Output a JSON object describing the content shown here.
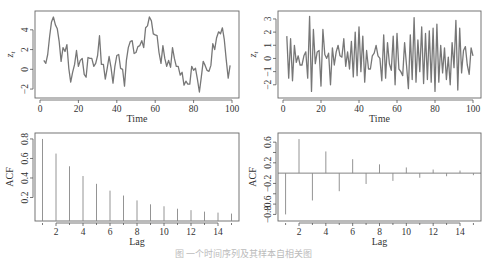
{
  "figure": {
    "caption": "图 一个时间序列及其样本自相关图"
  },
  "chart_data": [
    {
      "type": "line",
      "panel": "top-left",
      "xlabel": "Time",
      "ylabel": "z_t",
      "xlim": [
        0,
        100
      ],
      "ylim": [
        -2.5,
        5.5
      ],
      "xticks": [
        0,
        20,
        40,
        60,
        80,
        100
      ],
      "yticks": [
        -2,
        0,
        2,
        4
      ],
      "x": [
        2,
        3,
        4,
        5,
        6,
        7,
        8,
        9,
        10,
        11,
        12,
        13,
        14,
        15,
        16,
        17,
        18,
        19,
        20,
        21,
        22,
        23,
        24,
        25,
        26,
        27,
        28,
        29,
        30,
        31,
        32,
        33,
        34,
        35,
        36,
        37,
        38,
        39,
        40,
        41,
        42,
        43,
        44,
        45,
        46,
        47,
        48,
        49,
        50,
        51,
        52,
        53,
        54,
        55,
        56,
        57,
        58,
        59,
        60,
        61,
        62,
        63,
        64,
        65,
        66,
        67,
        68,
        69,
        70,
        71,
        72,
        73,
        74,
        75,
        76,
        77,
        78,
        79,
        80,
        81,
        82,
        83,
        84,
        85,
        86,
        87,
        88,
        89,
        90,
        91,
        92,
        93,
        94,
        95,
        96,
        97,
        98,
        99,
        100
      ],
      "values": [
        0.9,
        0.6,
        1.5,
        3.3,
        4.8,
        5.3,
        4.5,
        4.1,
        2.8,
        0.8,
        2.2,
        1.8,
        2.5,
        0.1,
        -1.3,
        -0.3,
        0.5,
        1.9,
        0.3,
        0.9,
        1.1,
        -0.5,
        -0.8,
        1.2,
        1.1,
        1.1,
        0.3,
        0.6,
        1.4,
        3.4,
        0.5,
        0.5,
        -1.0,
        0.1,
        1.3,
        0.2,
        -1.4,
        0.3,
        1.4,
        1.5,
        0.1,
        0.0,
        -1.7,
        0.9,
        2.2,
        2.8,
        2.9,
        1.6,
        1.7,
        2.3,
        2.4,
        2.9,
        2.2,
        4.2,
        4.4,
        5.3,
        4.9,
        3.6,
        3.5,
        3.4,
        1.7,
        0.6,
        2.4,
        1.1,
        0.3,
        0.9,
        0.2,
        2.2,
        1.1,
        0.3,
        0.3,
        -0.6,
        -0.3,
        -1.6,
        -1.2,
        -1.5,
        -1.5,
        0.3,
        -0.1,
        0.1,
        -1.0,
        -2.3,
        -0.8,
        0.8,
        0.4,
        -0.1,
        -0.2,
        0.4,
        2.6,
        2.0,
        3.2,
        3.8,
        3.6,
        4.2,
        3.0,
        1.0,
        -0.9,
        0.4
      ]
    },
    {
      "type": "line",
      "panel": "top-right",
      "xlabel": "Time",
      "ylabel": "z_t",
      "xlim": [
        0,
        100
      ],
      "ylim": [
        -2.7,
        3.3
      ],
      "xticks": [
        0,
        20,
        40,
        60,
        80,
        100
      ],
      "yticks": [
        -2,
        -1,
        0,
        1,
        2,
        3
      ],
      "x": [
        2,
        3,
        4,
        5,
        6,
        7,
        8,
        9,
        10,
        11,
        12,
        13,
        14,
        15,
        16,
        17,
        18,
        19,
        20,
        21,
        22,
        23,
        24,
        25,
        26,
        27,
        28,
        29,
        30,
        31,
        32,
        33,
        34,
        35,
        36,
        37,
        38,
        39,
        40,
        41,
        42,
        43,
        44,
        45,
        46,
        47,
        48,
        49,
        50,
        51,
        52,
        53,
        54,
        55,
        56,
        57,
        58,
        59,
        60,
        61,
        62,
        63,
        64,
        65,
        66,
        67,
        68,
        69,
        70,
        71,
        72,
        73,
        74,
        75,
        76,
        77,
        78,
        79,
        80,
        81,
        82,
        83,
        84,
        85,
        86,
        87,
        88,
        89,
        90,
        91,
        92,
        93,
        94,
        95,
        96,
        97,
        98,
        99,
        100
      ],
      "values": [
        1.7,
        -1.5,
        1.5,
        -1.7,
        1.0,
        -0.3,
        0.2,
        -0.5,
        -0.5,
        0.2,
        0.5,
        -1.5,
        3.2,
        -2.5,
        2.2,
        -0.4,
        0.5,
        0.6,
        -2.1,
        2.2,
        0.3,
        0.0,
        0.4,
        -2.0,
        0.8,
        -0.5,
        0.5,
        1.0,
        0.2,
        0.1,
        1.5,
        -0.6,
        0.5,
        -0.8,
        1.3,
        -1.4,
        2.0,
        -1.3,
        2.4,
        -1.0,
        1.7,
        -1.8,
        0.6,
        -0.8,
        -0.8,
        0.2,
        0.4,
        1.0,
        0.2,
        0.0,
        -1.7,
        1.8,
        -1.5,
        1.2,
        -0.4,
        -0.9,
        1.7,
        -2.0,
        1.9,
        -0.8,
        -1.0,
        -1.3,
        1.2,
        -0.5,
        -2.3,
        1.8,
        -1.6,
        3.1,
        -1.8,
        1.4,
        -1.0,
        2.4,
        -1.9,
        1.9,
        -1.6,
        2.1,
        -1.8,
        2.3,
        -2.5,
        2.6,
        -1.8,
        1.0,
        -1.1,
        0.8,
        -1.6,
        0.1,
        -2.0,
        1.2,
        -0.7,
        2.9,
        -2.4,
        2.3,
        -1.1,
        0.6,
        0.9,
        -0.5,
        -1.2,
        0.8,
        0.2
      ]
    },
    {
      "type": "bar",
      "panel": "bottom-left",
      "xlabel": "Lag",
      "ylabel": "ACF",
      "xlim": [
        0.5,
        15.5
      ],
      "ylim": [
        0,
        0.82
      ],
      "xticks": [
        2,
        4,
        6,
        8,
        10,
        12,
        14
      ],
      "yticks": [
        0.2,
        0.4,
        0.6,
        0.8
      ],
      "categories": [
        1,
        2,
        3,
        4,
        5,
        6,
        7,
        8,
        9,
        10,
        11,
        12,
        13,
        14,
        15
      ],
      "values": [
        0.8,
        0.65,
        0.52,
        0.42,
        0.34,
        0.27,
        0.22,
        0.17,
        0.13,
        0.11,
        0.085,
        0.07,
        0.055,
        0.045,
        0.035
      ]
    },
    {
      "type": "bar",
      "panel": "bottom-right",
      "xlabel": "Lag",
      "ylabel": "ACF",
      "xlim": [
        0.5,
        15.5
      ],
      "ylim": [
        -0.85,
        0.7
      ],
      "xticks": [
        2,
        4,
        6,
        8,
        10,
        12,
        14
      ],
      "yticks": [
        -0.8,
        -0.6,
        -0.2,
        0.2,
        0.6
      ],
      "ytick_labels": [
        "-0.8",
        "-0.6",
        "-0.2",
        "0.2",
        "0.6"
      ],
      "categories": [
        1,
        2,
        3,
        4,
        5,
        6,
        7,
        8,
        9,
        10,
        11,
        12,
        13,
        14,
        15
      ],
      "values": [
        -0.8,
        0.66,
        -0.53,
        0.42,
        -0.35,
        0.27,
        -0.21,
        0.17,
        -0.15,
        0.11,
        -0.09,
        0.07,
        -0.06,
        0.05,
        -0.04
      ]
    }
  ],
  "labels": {
    "time": "Time",
    "lag": "Lag",
    "acf": "ACF",
    "zt": "z",
    "zt_sub": "t"
  }
}
